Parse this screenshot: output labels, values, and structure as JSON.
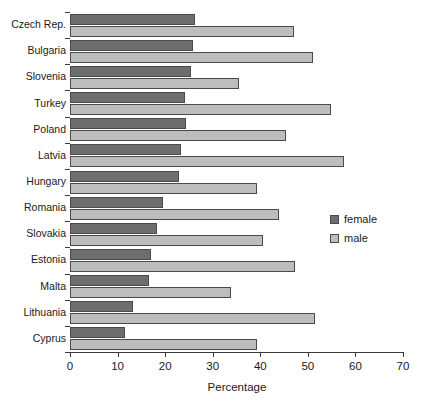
{
  "chart_data": {
    "type": "bar",
    "orientation": "horizontal",
    "title": "",
    "xlabel": "Percentage",
    "ylabel": "",
    "xlim": [
      0,
      70
    ],
    "xticks": [
      0,
      10,
      20,
      30,
      40,
      50,
      60,
      70
    ],
    "grid": false,
    "legend_position": "right",
    "categories": [
      "Czech Rep.",
      "Bulgaria",
      "Slovenia",
      "Turkey",
      "Poland",
      "Latvia",
      "Hungary",
      "Romania",
      "Slovakia",
      "Estonia",
      "Malta",
      "Lithuania",
      "Cyprus"
    ],
    "series": [
      {
        "name": "female",
        "color": "#6e6e6e",
        "values": [
          26.3,
          25.9,
          25.4,
          24.2,
          24.4,
          23.3,
          22.9,
          19.6,
          18.3,
          17.0,
          16.6,
          13.2,
          11.5
        ]
      },
      {
        "name": "male",
        "color": "#bdbdbd",
        "values": [
          47.1,
          51.1,
          35.5,
          54.9,
          45.4,
          57.6,
          39.3,
          44.0,
          40.6,
          47.3,
          33.8,
          51.5,
          39.3
        ]
      }
    ]
  },
  "legend": {
    "items": [
      {
        "label": "female",
        "swatch": "female-swatch"
      },
      {
        "label": "male",
        "swatch": "male-swatch"
      }
    ]
  },
  "axis": {
    "x_title": "Percentage"
  }
}
